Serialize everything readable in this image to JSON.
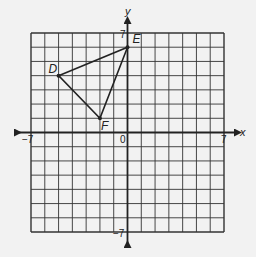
{
  "figure": {
    "type": "coordinate-grid",
    "background": "#f2f2f2",
    "ink": "#222222",
    "axes": {
      "x_label": "x",
      "y_label": "y",
      "x_min_label": "−7",
      "x_max_label": "7",
      "y_max_label": "7",
      "y_min_label": "−7",
      "origin_label": "0"
    },
    "points": [
      {
        "name": "D",
        "x": -5,
        "y": 4
      },
      {
        "name": "E",
        "x": 0,
        "y": 6
      },
      {
        "name": "F",
        "x": -2,
        "y": 1
      }
    ],
    "polygon": [
      "D",
      "E",
      "F"
    ]
  },
  "chart_data": {
    "type": "scatter",
    "title": "",
    "xlabel": "x",
    "ylabel": "y",
    "xlim": [
      -7,
      7
    ],
    "ylim": [
      -7,
      7
    ],
    "grid": true,
    "series": [
      {
        "name": "Triangle DEF",
        "points": [
          {
            "label": "D",
            "x": -5,
            "y": 4
          },
          {
            "label": "E",
            "x": 0,
            "y": 6
          },
          {
            "label": "F",
            "x": -2,
            "y": 1
          }
        ],
        "closed": true
      }
    ]
  }
}
